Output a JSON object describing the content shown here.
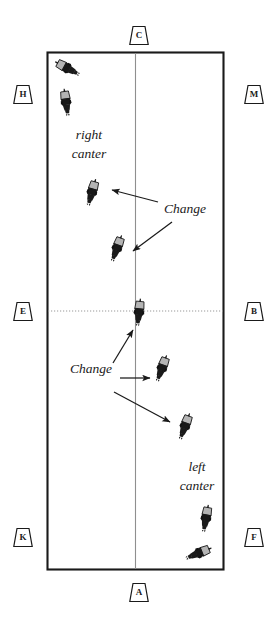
{
  "diagram": {
    "type": "arena-diagram",
    "colors": {
      "background": "#ffffff",
      "arena_border": "#1a1a1a",
      "centerline": "#8a8a8a",
      "dotted_line": "#9a9a9a",
      "horse_body": "#1a1a1a",
      "horse_hind": "#b0b0b0",
      "arrow": "#1a1a1a",
      "text": "#1a1a1a"
    },
    "arena": {
      "x": 47,
      "y": 52,
      "width": 177,
      "height": 518
    }
  },
  "markers": [
    {
      "letter": "C",
      "name": "marker-c",
      "x": 139,
      "y": 35,
      "side": "top"
    },
    {
      "letter": "H",
      "name": "marker-h",
      "x": 23,
      "y": 94,
      "side": "left"
    },
    {
      "letter": "M",
      "name": "marker-m",
      "x": 254,
      "y": 94,
      "side": "right"
    },
    {
      "letter": "E",
      "name": "marker-e",
      "x": 23,
      "y": 311,
      "side": "left"
    },
    {
      "letter": "B",
      "name": "marker-b",
      "x": 254,
      "y": 311,
      "side": "right"
    },
    {
      "letter": "K",
      "name": "marker-k",
      "x": 23,
      "y": 537,
      "side": "left"
    },
    {
      "letter": "F",
      "name": "marker-f",
      "x": 254,
      "y": 537,
      "side": "right"
    },
    {
      "letter": "A",
      "name": "marker-a",
      "x": 139,
      "y": 592,
      "side": "bottom"
    }
  ],
  "labels": {
    "right_canter": {
      "line1": "right",
      "line2": "canter",
      "x": 89,
      "y": 136
    },
    "left_canter": {
      "line1": "left",
      "line2": "canter",
      "x": 197,
      "y": 468
    },
    "change_upper": {
      "text": "Change",
      "x": 185,
      "y": 210
    },
    "change_lower": {
      "text": "Change",
      "x": 91,
      "y": 370
    }
  },
  "horses": [
    {
      "name": "horse-1",
      "x": 67,
      "y": 68,
      "rotation": 118,
      "scale": 1.0
    },
    {
      "name": "horse-2",
      "x": 66,
      "y": 102,
      "rotation": 172,
      "scale": 1.0
    },
    {
      "name": "horse-3",
      "x": 92,
      "y": 192,
      "rotation": 196,
      "scale": 1.0
    },
    {
      "name": "horse-4",
      "x": 117,
      "y": 248,
      "rotation": 200,
      "scale": 1.0
    },
    {
      "name": "horse-5",
      "x": 139,
      "y": 312,
      "rotation": 186,
      "scale": 1.0
    },
    {
      "name": "horse-6",
      "x": 162,
      "y": 368,
      "rotation": 200,
      "scale": 1.0
    },
    {
      "name": "horse-7",
      "x": 185,
      "y": 426,
      "rotation": 200,
      "scale": 1.0
    },
    {
      "name": "horse-8",
      "x": 206,
      "y": 518,
      "rotation": 190,
      "scale": 1.0
    },
    {
      "name": "horse-9",
      "x": 199,
      "y": 553,
      "rotation": 248,
      "scale": 1.0
    }
  ],
  "arrows": [
    {
      "name": "arrow-change-upper-to-horse3",
      "x1": 158,
      "y1": 202,
      "x2": 112,
      "y2": 190
    },
    {
      "name": "arrow-change-upper-to-horse4",
      "x1": 172,
      "y1": 222,
      "x2": 133,
      "y2": 251
    },
    {
      "name": "arrow-change-lower-to-horse5",
      "x1": 113,
      "y1": 363,
      "x2": 133,
      "y2": 330
    },
    {
      "name": "arrow-change-lower-to-horse6",
      "x1": 120,
      "y1": 378,
      "x2": 150,
      "y2": 378
    },
    {
      "name": "arrow-change-lower-to-horse7",
      "x1": 114,
      "y1": 392,
      "x2": 170,
      "y2": 422
    }
  ]
}
